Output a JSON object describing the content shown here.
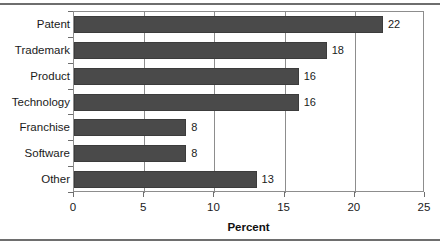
{
  "chart_data": {
    "type": "bar",
    "orientation": "horizontal",
    "title": "",
    "xlabel": "Percent",
    "ylabel": "",
    "categories": [
      "Patent",
      "Trademark",
      "Product",
      "Technology",
      "Franchise",
      "Software",
      "Other"
    ],
    "values": [
      22,
      18,
      16,
      16,
      8,
      8,
      13
    ],
    "value_labels": [
      "22",
      "18",
      "16",
      "16",
      "8",
      "8",
      "13"
    ],
    "xlim": [
      0,
      25
    ],
    "xticks": [
      0,
      5,
      10,
      15,
      20,
      25
    ],
    "xtick_labels": [
      "0",
      "5",
      "10",
      "15",
      "20",
      "25"
    ],
    "grid": "vertical",
    "legend": "none",
    "bar_color": "#4a4a4a",
    "axis_color": "#8d8d8d",
    "rule_color": "#6e6e6e",
    "background": "#ffffff"
  }
}
